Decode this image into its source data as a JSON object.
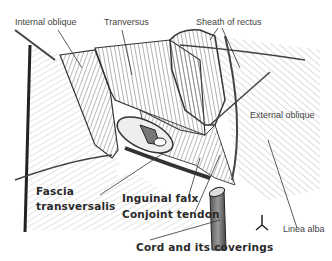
{
  "diagram": {
    "type": "anatomical illustration",
    "labels": {
      "internal_oblique": "Internal oblique",
      "transversus": "Tranversus",
      "sheath_of_rectus": "Sheath of rectus",
      "external_oblique": "External oblique",
      "fascia": "Fascia",
      "transversalis": "transversalis",
      "inguinal_falx": "Inguinal falx",
      "conjoint_tendon": "Conjoint tendon",
      "linea_alba": "Linea alba",
      "cord": "Cord and its coverings"
    },
    "colors": {
      "line": "#3a3a3a",
      "muscle_shade": "#9a9a9a",
      "background": "#ffffff"
    }
  }
}
